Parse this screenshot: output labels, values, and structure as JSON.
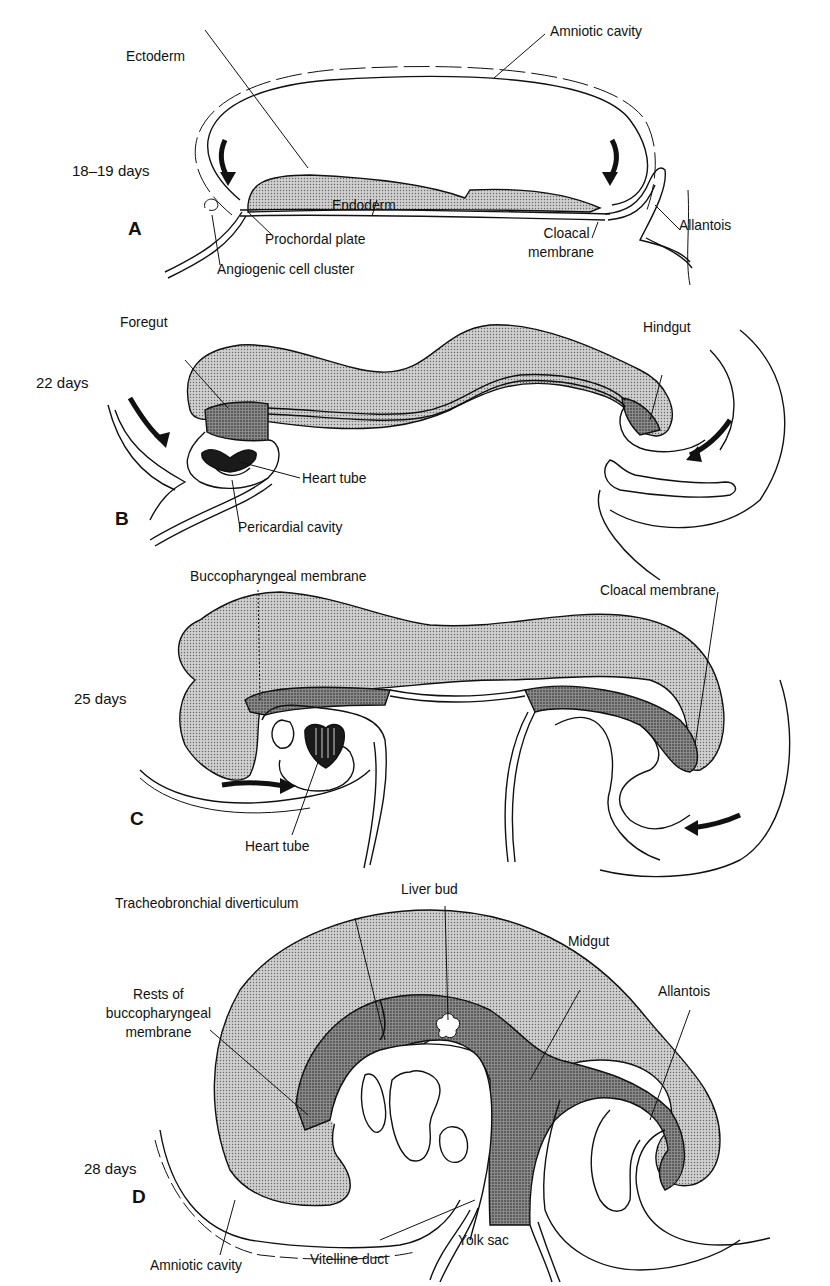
{
  "figure": {
    "panels": [
      {
        "letter": "A",
        "age": "18–19 days",
        "labels": {
          "ectoderm": "Ectoderm",
          "amniotic_cavity": "Amniotic cavity",
          "endoderm": "Endoderm",
          "prochordal_plate": "Prochordal plate",
          "angiogenic_cell_cluster": "Angiogenic cell cluster",
          "cloacal_membrane_1": "Cloacal",
          "cloacal_membrane_2": "membrane",
          "allantois": "Allantois"
        }
      },
      {
        "letter": "B",
        "age": "22 days",
        "labels": {
          "foregut": "Foregut",
          "hindgut": "Hindgut",
          "heart_tube": "Heart tube",
          "pericardial_cavity": "Pericardial cavity"
        }
      },
      {
        "letter": "C",
        "age": "25 days",
        "labels": {
          "buccopharyngeal_membrane": "Buccopharyngeal membrane",
          "cloacal_membrane": "Cloacal membrane",
          "heart_tube": "Heart tube"
        }
      },
      {
        "letter": "D",
        "age": "28 days",
        "labels": {
          "tracheobronchial_diverticulum": "Tracheobronchial diverticulum",
          "liver_bud": "Liver bud",
          "midgut": "Midgut",
          "rests_1": "Rests of",
          "rests_2": "buccopharyngeal",
          "rests_3": "membrane",
          "allantois": "Allantois",
          "amniotic_cavity": "Amniotic cavity",
          "vitelline_duct": "Vitelline duct",
          "yolk_sac": "Yolk sac"
        }
      }
    ],
    "colors": {
      "ink": "#111111",
      "ectoderm_fill": "#bdbdbd",
      "endoderm_fill": "#7a7a7a",
      "heart_fill": "#1a1a1a"
    }
  }
}
